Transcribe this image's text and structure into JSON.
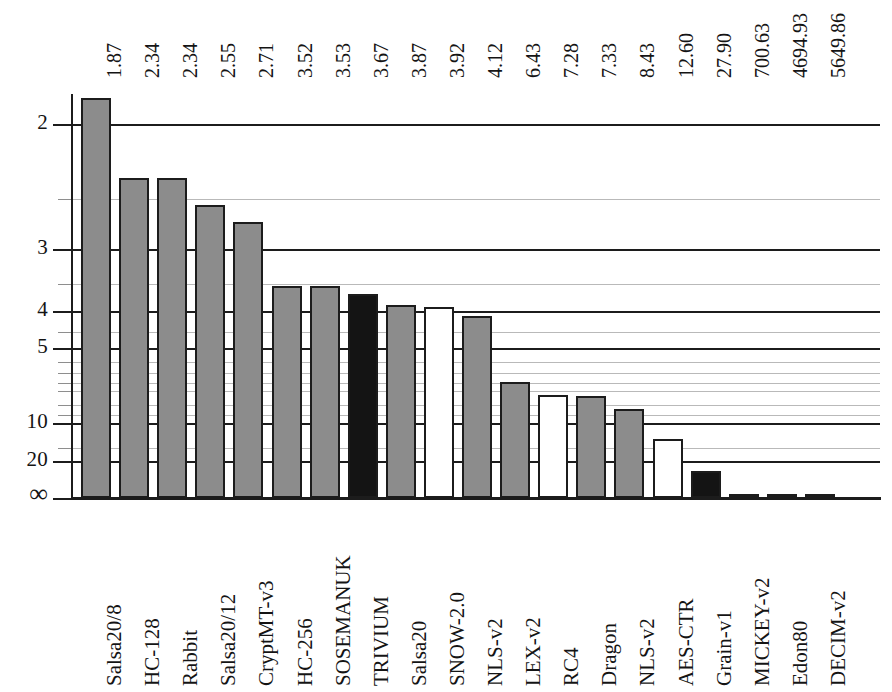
{
  "chart_data": {
    "type": "bar",
    "title": "",
    "subtitle": "",
    "xlabel": "",
    "ylabel": "",
    "orientation": "vertical",
    "y_scale": "reciprocal",
    "y_axis_note": "Axis increases downward; labelled cycles/byte values 2,3,4,5,10,20 and infinity at the baseline",
    "ytick_labels": [
      "2",
      "3",
      "4",
      "5",
      "10",
      "20",
      "∞"
    ],
    "ytick_values": [
      2,
      3,
      4,
      5,
      10,
      20,
      0
    ],
    "minor_ytick_values": [
      2.5,
      3.5,
      4.5,
      5.5,
      6,
      6.5,
      7,
      8,
      9,
      15
    ],
    "grid": true,
    "legend": "none",
    "categories": [
      "Salsa20/8",
      "HC-128",
      "Rabbit",
      "Salsa20/12",
      "CryptMT-v3",
      "HC-256",
      "SOSEMANUK",
      "TRIVIUM",
      "Salsa20",
      "SNOW-2.0",
      "NLS-v2",
      "LEX-v2",
      "RC4",
      "Dragon",
      "NLS-v2",
      "AES-CTR",
      "Grain-v1",
      "MICKEY-v2",
      "Edon80",
      "DECIM-v2"
    ],
    "values": [
      1.87,
      2.34,
      2.34,
      2.55,
      2.71,
      3.52,
      3.53,
      3.67,
      3.87,
      3.92,
      4.12,
      6.43,
      7.28,
      7.33,
      8.43,
      12.6,
      27.9,
      700.63,
      4694.93,
      5649.86
    ],
    "value_labels": [
      "1.87",
      "2.34",
      "2.34",
      "2.55",
      "2.71",
      "3.52",
      "3.53",
      "3.67",
      "3.87",
      "3.92",
      "4.12",
      "6.43",
      "7.28",
      "7.33",
      "8.43",
      "12.60",
      "27.90",
      "700.63",
      "4694.93",
      "5649.86"
    ],
    "bar_styles": [
      "gray",
      "gray",
      "gray",
      "gray",
      "gray",
      "gray",
      "gray",
      "black",
      "gray",
      "white",
      "gray",
      "gray",
      "white",
      "gray",
      "gray",
      "white",
      "black",
      "gray",
      "white",
      "white"
    ],
    "colors": {
      "gray": "#8c8c8c",
      "white": "#ffffff",
      "black": "#141414",
      "outline": "#1c1c1c",
      "gridline_major": "#1c1c1c",
      "gridline_minor": "#b9b9b9"
    },
    "ylim": [
      1.78,
      0
    ]
  }
}
